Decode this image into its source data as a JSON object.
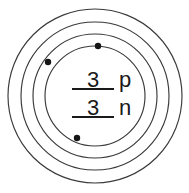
{
  "diagram": {
    "type": "bohr-atom-shell-diagram",
    "canvas": {
      "width": 189,
      "height": 193,
      "background": "#ffffff"
    },
    "stroke_color": "#3a3a3a",
    "text_color": "#1a1a1a",
    "electron_color": "#151515",
    "center": {
      "x": 95,
      "y": 96
    },
    "nucleus": {
      "proton_count": "3",
      "proton_symbol": "p",
      "neutron_count": "3",
      "neutron_symbol": "n",
      "radius": 50
    },
    "rings": [
      {
        "name": "outer-shell-ring",
        "radius": 87
      },
      {
        "name": "middle-shell-ring",
        "radius": 74
      },
      {
        "name": "inner-shell-ring",
        "radius": 62
      },
      {
        "name": "nucleus-ring",
        "radius": 50
      }
    ],
    "electrons": [
      {
        "name": "electron-top",
        "x": 98,
        "y": 46,
        "radius": 3.2,
        "shell": "nucleus-ring"
      },
      {
        "name": "electron-upper-left",
        "x": 48,
        "y": 62,
        "radius": 3.2,
        "shell": "inner-shell-ring"
      },
      {
        "name": "electron-bottom-left",
        "x": 77,
        "y": 138,
        "radius": 3.2,
        "shell": "nucleus-ring"
      }
    ],
    "rules": [
      {
        "name": "proton-underline",
        "x1": 72,
        "x2": 114,
        "y": 89
      },
      {
        "name": "neutron-underline",
        "x1": 72,
        "x2": 114,
        "y": 117
      }
    ],
    "labels": {
      "proton_count_pos": {
        "x": 93,
        "y": 87
      },
      "proton_symbol_pos": {
        "x": 119,
        "y": 87
      },
      "neutron_count_pos": {
        "x": 93,
        "y": 115
      },
      "neutron_symbol_pos": {
        "x": 119,
        "y": 115
      }
    }
  }
}
